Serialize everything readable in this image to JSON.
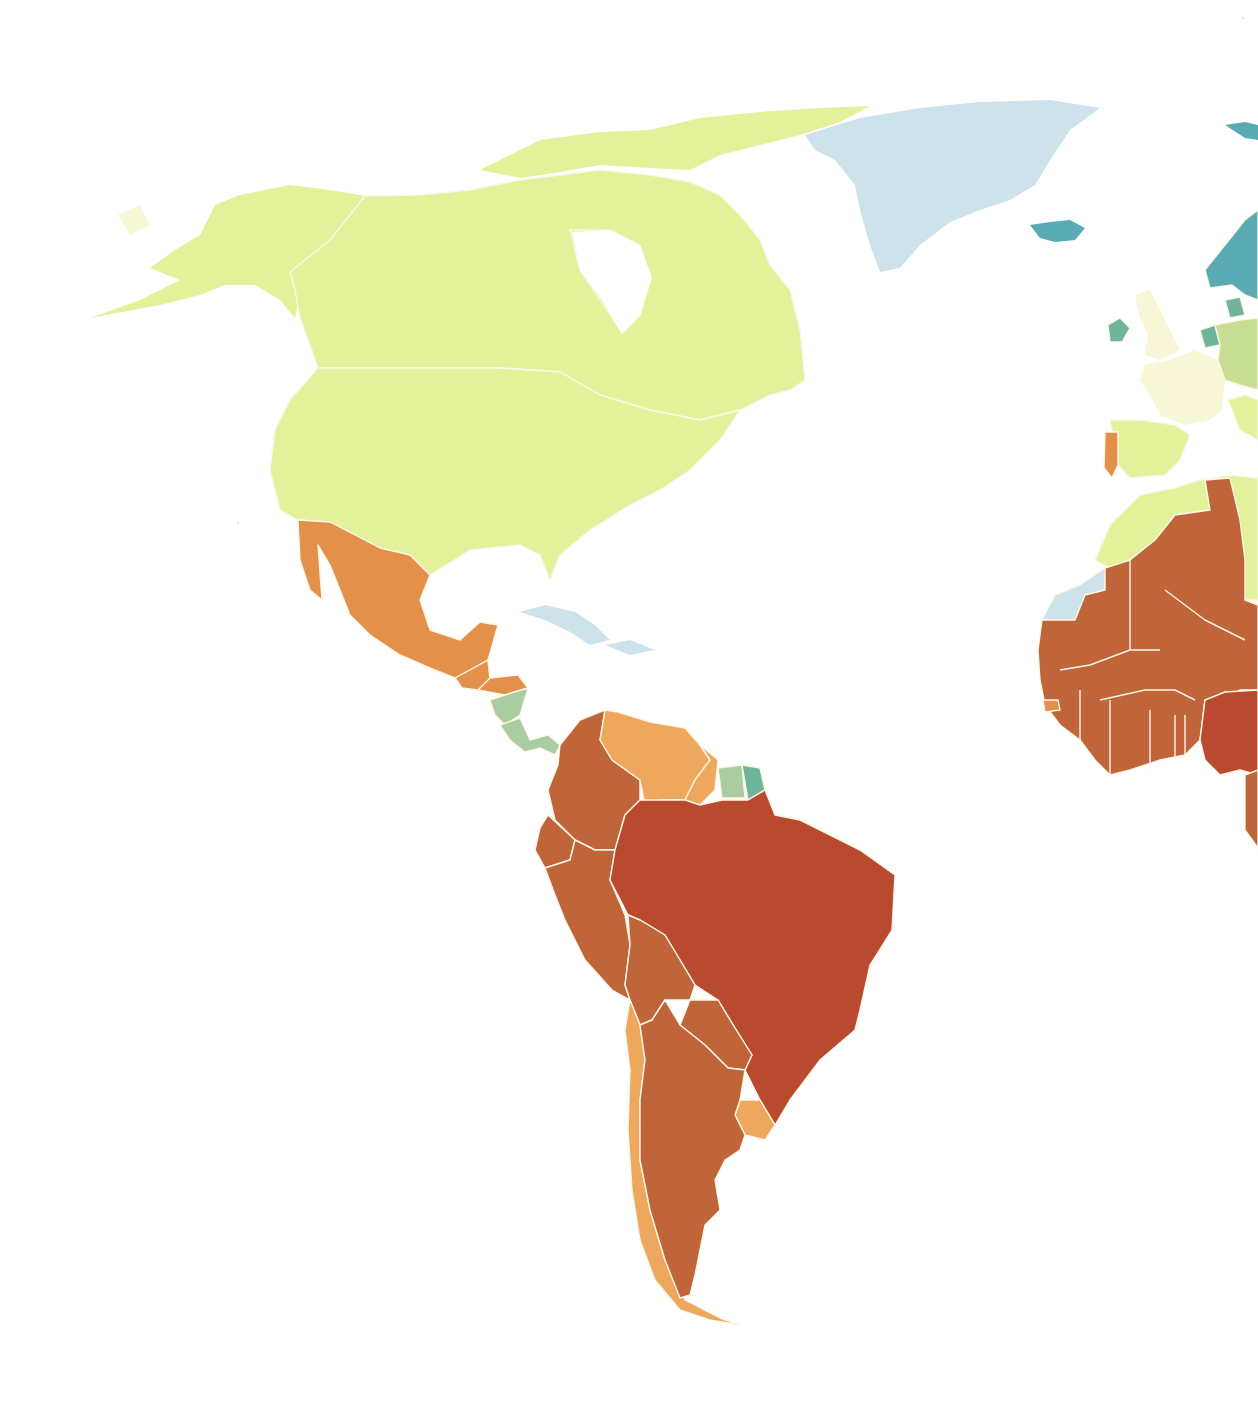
{
  "map": {
    "type": "choropleth",
    "region_visible": "Americas, Greenland, Western Europe, West Africa",
    "legend_visible": false,
    "title_visible": false,
    "palette": {
      "class_1_dark_red": "#b94a30",
      "class_2_rust": "#c0643a",
      "class_3_orange": "#e3914a",
      "class_4_light_orange": "#eea85e",
      "class_5_pale_yellow": "#f7f6d6",
      "class_6_yellow_green": "#e2f19a",
      "class_7_light_green": "#c7dd94",
      "class_8_sage_green": "#a9cca0",
      "class_9_sea_green": "#6fb59b",
      "class_10_teal": "#5aaab3",
      "class_11_light_blue": "#cde2ea",
      "background": "#ffffff",
      "border": "#fbf6e6"
    },
    "regions": [
      {
        "name": "alaska",
        "class": "class_6_yellow_green"
      },
      {
        "name": "canada",
        "class": "class_6_yellow_green"
      },
      {
        "name": "usa",
        "class": "class_6_yellow_green"
      },
      {
        "name": "greenland",
        "class": "class_11_light_blue"
      },
      {
        "name": "caribbean",
        "class": "class_11_light_blue"
      },
      {
        "name": "mexico",
        "class": "class_3_orange"
      },
      {
        "name": "guatemala",
        "class": "class_3_orange"
      },
      {
        "name": "honduras",
        "class": "class_3_orange"
      },
      {
        "name": "nicaragua",
        "class": "class_8_sage_green"
      },
      {
        "name": "costa-rica-panama",
        "class": "class_8_sage_green"
      },
      {
        "name": "colombia",
        "class": "class_2_rust"
      },
      {
        "name": "venezuela",
        "class": "class_4_light_orange"
      },
      {
        "name": "guyana",
        "class": "class_4_light_orange"
      },
      {
        "name": "suriname",
        "class": "class_8_sage_green"
      },
      {
        "name": "french-guiana",
        "class": "class_9_sea_green"
      },
      {
        "name": "ecuador",
        "class": "class_2_rust"
      },
      {
        "name": "peru",
        "class": "class_2_rust"
      },
      {
        "name": "brazil",
        "class": "class_1_dark_red"
      },
      {
        "name": "bolivia",
        "class": "class_2_rust"
      },
      {
        "name": "paraguay",
        "class": "class_2_rust"
      },
      {
        "name": "chile",
        "class": "class_4_light_orange"
      },
      {
        "name": "argentina",
        "class": "class_2_rust"
      },
      {
        "name": "uruguay",
        "class": "class_4_light_orange"
      },
      {
        "name": "iceland",
        "class": "class_10_teal"
      },
      {
        "name": "ireland",
        "class": "class_9_sea_green"
      },
      {
        "name": "uk",
        "class": "class_5_pale_yellow"
      },
      {
        "name": "norway-sweden",
        "class": "class_10_teal"
      },
      {
        "name": "denmark-netherlands",
        "class": "class_9_sea_green"
      },
      {
        "name": "germany",
        "class": "class_7_light_green"
      },
      {
        "name": "france",
        "class": "class_5_pale_yellow"
      },
      {
        "name": "spain",
        "class": "class_6_yellow_green"
      },
      {
        "name": "portugal",
        "class": "class_3_orange"
      },
      {
        "name": "morocco-algeria",
        "class": "class_6_yellow_green"
      },
      {
        "name": "western-sahara",
        "class": "class_11_light_blue"
      },
      {
        "name": "west-africa",
        "class": "class_2_rust"
      },
      {
        "name": "nigeria",
        "class": "class_1_dark_red"
      },
      {
        "name": "svalbard",
        "class": "class_10_teal"
      }
    ]
  }
}
